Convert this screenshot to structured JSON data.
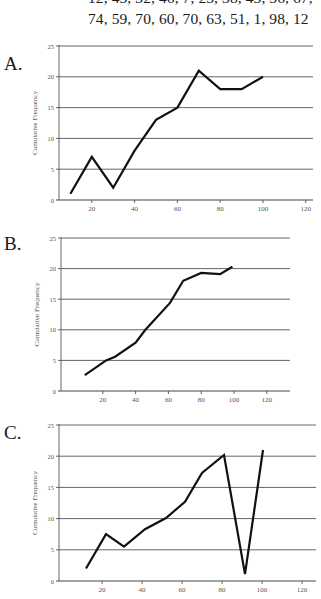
{
  "problem": {
    "data_line_1": "12, 45, 32, 46, 7, 23, 38, 45, 56, 67,",
    "data_line_2": "74, 59, 70, 60, 70, 63, 51, 1, 98, 12"
  },
  "chart_data": [
    {
      "id": "A",
      "option_label": "A.",
      "type": "line",
      "title": "",
      "xlabel": "",
      "ylabel": "Cumulative Frequency",
      "x_ticks": [
        20,
        40,
        60,
        80,
        100,
        120
      ],
      "y_ticks": [
        0,
        5,
        10,
        15,
        20,
        25
      ],
      "xlim": [
        0,
        125
      ],
      "ylim": [
        0,
        25
      ],
      "grid": "horizontal",
      "legend": "none",
      "x": [
        10,
        20,
        30,
        40,
        50,
        60,
        70,
        80,
        90,
        100
      ],
      "values": [
        1,
        7,
        2,
        8,
        13,
        15,
        21,
        18,
        18,
        20
      ]
    },
    {
      "id": "B",
      "option_label": "B.",
      "type": "line",
      "title": "",
      "xlabel": "",
      "ylabel": "Cumulative Frequency",
      "x_ticks": [
        20,
        40,
        60,
        80,
        100,
        120
      ],
      "y_ticks": [
        0,
        5,
        10,
        15,
        20,
        25
      ],
      "xlim": [
        0,
        135
      ],
      "ylim": [
        0,
        25
      ],
      "grid": "horizontal",
      "legend": "none",
      "x": [
        9,
        22,
        27.5,
        40,
        46,
        61,
        69,
        80,
        91.5,
        99
      ],
      "values": [
        2.6,
        5,
        5.6,
        7.9,
        10,
        14.4,
        18,
        19.3,
        19.1,
        20.3
      ]
    },
    {
      "id": "C",
      "option_label": "C.",
      "type": "line",
      "title": "",
      "xlabel": "",
      "ylabel": "Cumulative Frequency",
      "x_ticks": [
        20,
        40,
        60,
        80,
        100,
        120
      ],
      "y_ticks": [
        0,
        5,
        10,
        15,
        20,
        25
      ],
      "xlim": [
        0,
        127
      ],
      "ylim": [
        0,
        25
      ],
      "grid": "horizontal",
      "legend": "none",
      "x": [
        12,
        22,
        31,
        41.5,
        52,
        61.5,
        70,
        81,
        91.5,
        100.5
      ],
      "values": [
        2,
        7.5,
        5.5,
        8.3,
        10.1,
        12.7,
        17.3,
        20.2,
        1.1,
        21
      ]
    }
  ]
}
